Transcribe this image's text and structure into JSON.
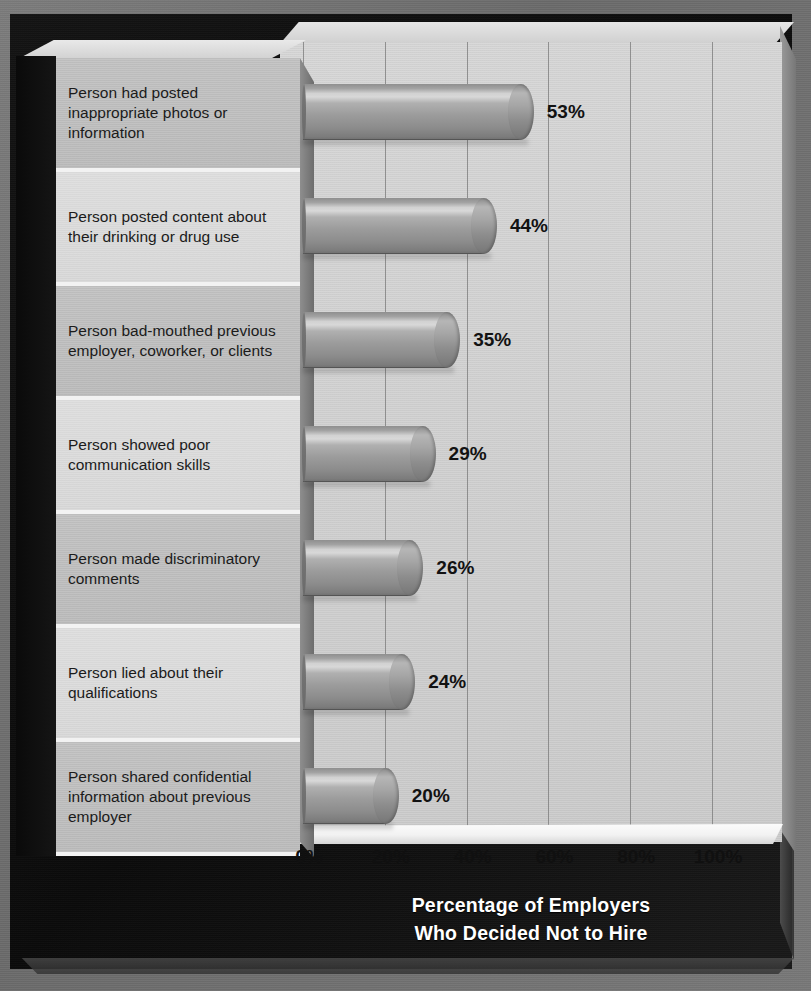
{
  "chart_data": {
    "type": "bar",
    "orientation": "horizontal",
    "title": "Percentage of Employers\nWho Decided Not to Hire",
    "title_line1": "Percentage of Employers",
    "title_line2": "Who Decided Not to Hire",
    "xlabel": "",
    "ylabel": "",
    "xlim": [
      0,
      110
    ],
    "grid": true,
    "legend": "none",
    "categories": [
      "Person had posted inappropriate photos or information",
      "Person posted content about their drinking or drug use",
      "Person bad-mouthed previous employer, coworker, or clients",
      "Person showed poor communication skills",
      "Person made discriminatory comments",
      "Person lied about their qualifications",
      "Person shared confidential information about previous employer"
    ],
    "values": [
      53,
      44,
      35,
      29,
      26,
      24,
      20
    ],
    "value_labels": [
      "53%",
      "44%",
      "35%",
      "29%",
      "26%",
      "24%",
      "20%"
    ],
    "xticks": [
      0,
      20,
      40,
      60,
      80,
      100
    ],
    "xtick_labels": [
      "0%",
      "20%",
      "40%",
      "60%",
      "80%",
      "100%"
    ],
    "colors": {
      "bar": "#9c9c9c",
      "bar_highlight": "#d8d8d8",
      "plot_background": "#d4d4d4",
      "board_background": "#101010",
      "page_background": "#717171",
      "label_row_dark": "#c0c0c0",
      "label_row_light": "#dbdbdb",
      "title_text": "#ffffff",
      "axis_text": "#101010"
    }
  },
  "rows": [
    {
      "label": "Person had posted inappropriate photos or information",
      "value_label": "53%"
    },
    {
      "label": "Person posted content about their drinking or drug use",
      "value_label": "44%"
    },
    {
      "label": "Person bad-mouthed previous employer, coworker, or clients",
      "value_label": "35%"
    },
    {
      "label": "Person showed poor communication skills",
      "value_label": "29%"
    },
    {
      "label": "Person made discriminatory comments",
      "value_label": "26%"
    },
    {
      "label": "Person lied about their qualifications",
      "value_label": "24%"
    },
    {
      "label": "Person shared confidential information about previous employer",
      "value_label": "20%"
    }
  ]
}
